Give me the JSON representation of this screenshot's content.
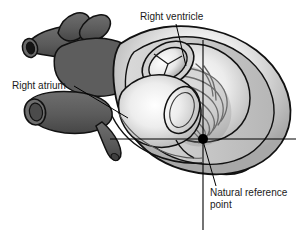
{
  "figure": {
    "type": "anatomical-illustration",
    "background_color": "#ffffff",
    "width": 308,
    "height": 234
  },
  "labels": [
    {
      "id": "right-ventricle",
      "text": "Right ventricle",
      "x": 140,
      "y": 20,
      "anchor": "start",
      "leader": "from label down-right into the right ventricular cavity"
    },
    {
      "id": "right-atrium",
      "text": "Right atrium",
      "x": 12,
      "y": 89,
      "anchor": "start",
      "leader": "from label right into the right atrial cavity"
    },
    {
      "id": "natural-reference-point-line1",
      "text": "Natural reference",
      "x": 210,
      "y": 196,
      "anchor": "start",
      "leader": "from label up-left to the marked dot"
    },
    {
      "id": "natural-reference-point-line2",
      "text": "point",
      "x": 210,
      "y": 208,
      "anchor": "start",
      "leader": "none"
    }
  ],
  "reference_point": {
    "name": "Natural reference point",
    "x": 203,
    "y": 139,
    "radius": 5,
    "color": "#000000"
  },
  "axes": {
    "horizontal": {
      "x1": 110,
      "y1": 139,
      "x2": 296,
      "y2": 139
    },
    "vertical": {
      "x1": 203,
      "y1": 40,
      "x2": 203,
      "y2": 230
    },
    "color": "#000000",
    "stroke_width": 1.1
  },
  "structures": [
    {
      "id": "superior-vena-cava",
      "label": "Superior vena cava",
      "tone": "dark-gray"
    },
    {
      "id": "pulmonary-artery-branch",
      "label": "Pulmonary artery branch",
      "tone": "dark-gray"
    },
    {
      "id": "inferior-vena-cava",
      "label": "Inferior vena cava",
      "tone": "dark-gray"
    },
    {
      "id": "coronary-vessel-stub",
      "label": "Coronary vessel stub",
      "tone": "dark-gray"
    },
    {
      "id": "right-atrium-cavity",
      "label": "Right atrium cavity",
      "tone": "light-highlight"
    },
    {
      "id": "right-ventricle-cavity",
      "label": "Right ventricle cavity",
      "tone": "light-highlight"
    },
    {
      "id": "pulmonary-valve",
      "label": "Pulmonary valve (three leaflets)",
      "tone": "light-highlight"
    },
    {
      "id": "tricuspid-valve-ring",
      "label": "Tricuspid valve ring",
      "tone": "mid-gray"
    },
    {
      "id": "trabeculae-carneae",
      "label": "Trabeculae carneae (muscle ridges)",
      "tone": "mid-gray"
    },
    {
      "id": "left-ventricle-mass",
      "label": "Left ventricle muscle mass",
      "tone": "light-highlight"
    },
    {
      "id": "myocardium-wall",
      "label": "Myocardial wall",
      "tone": "mid-gray"
    },
    {
      "id": "apex",
      "label": "Cardiac apex",
      "tone": "dark-gray"
    }
  ],
  "palette": {
    "outline": "#111111",
    "vessel_dark": "#5d5d5d",
    "vessel_dark_shadow": "#4a4a4a",
    "muscle_mid": "#8f8f8f",
    "muscle_light": "#c9c9c9",
    "cavity_highlight": "#fbfbfb",
    "wall_pale": "#e4e4e4",
    "text": "#1a1a1a"
  }
}
